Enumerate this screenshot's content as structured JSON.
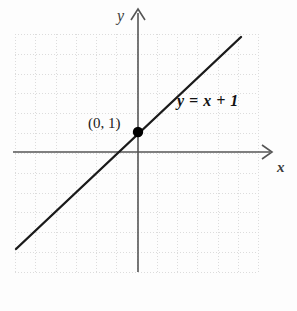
{
  "figure": {
    "kind": "cartesian-line-graph",
    "background_color": "#fdfdfd",
    "axis_color": "#555555",
    "grid_color": "#dcdcdc",
    "line_color": "#1a1a1a",
    "point_color": "#000000"
  },
  "axes": {
    "y_label": "y",
    "x_label": "x"
  },
  "annotations": {
    "equation": "y = x + 1",
    "point": "(0, 1)"
  },
  "chart_data": {
    "type": "line",
    "title": "",
    "xlabel": "x",
    "ylabel": "y",
    "equation": "y = x + 1",
    "slope": 1,
    "intercept": 1,
    "grid": true,
    "legend": "none",
    "xlim": [
      -6.2,
      6,
      0
    ],
    "ylim": [
      -6.0,
      6.0
    ],
    "series": [
      {
        "name": "y = x + 1",
        "x": [
          -6.1,
          5.1
        ],
        "y": [
          -5.1,
          6.1
        ]
      }
    ],
    "points": [
      {
        "label": "(0, 1)",
        "x": 0,
        "y": 1,
        "marker": "filled-circle"
      }
    ],
    "annotations": [
      {
        "text": "y = x + 1",
        "x": 2.0,
        "y": 3.1
      },
      {
        "text": "(0, 1)",
        "x": -2.3,
        "y": 1.85
      }
    ]
  }
}
